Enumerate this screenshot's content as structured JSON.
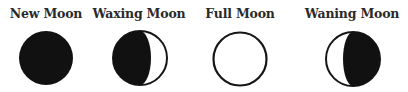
{
  "diagram": {
    "colors": {
      "background": "#ffffff",
      "dark": "#111111",
      "outline": "#161616",
      "label": "#2a2a2a"
    },
    "phases": [
      {
        "label": "New Moon",
        "icon": "new-moon-icon",
        "center_x": 46,
        "center_y": 58,
        "radius": 27,
        "shaded": "full"
      },
      {
        "label": "Waxing Moon",
        "icon": "waxing-moon-icon",
        "center_x": 140,
        "center_y": 58,
        "radius": 27,
        "shaded": "left-gibbous"
      },
      {
        "label": "Full Moon",
        "icon": "full-moon-icon",
        "center_x": 240,
        "center_y": 59,
        "radius": 27,
        "shaded": "none"
      },
      {
        "label": "Waning Moon",
        "icon": "waning-moon-icon",
        "center_x": 353,
        "center_y": 59,
        "radius": 27,
        "shaded": "right-gibbous"
      }
    ]
  }
}
